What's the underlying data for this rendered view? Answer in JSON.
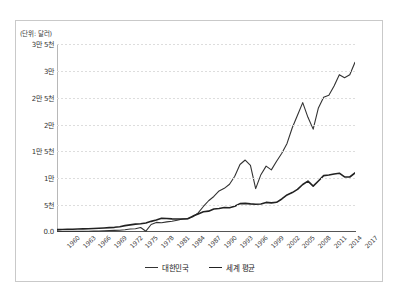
{
  "figure": {
    "unit_label": "(단위: 달러)",
    "accent_primary": "#333333",
    "accent_secondary": "#222222",
    "grid_color": "#dddddd",
    "frame_color": "#c9c9c9"
  },
  "legend": {
    "position": "bottom-center",
    "items": [
      {
        "label": "대한민국",
        "color": "#333333"
      },
      {
        "label": "세계 평균",
        "color": "#222222"
      }
    ]
  },
  "chart_data": {
    "type": "line",
    "title": "",
    "subtitle": "",
    "xlabel": "",
    "ylabel": "(단위: 달러)",
    "grid": true,
    "legend_position": "bottom-center",
    "ylim": [
      0,
      35000
    ],
    "ytick_values": [
      0,
      5000,
      10000,
      15000,
      20000,
      25000,
      30000,
      35000
    ],
    "ytick_labels": [
      "0.0",
      "5천",
      "1만",
      "1만 5천",
      "2만",
      "2만 5천",
      "3만",
      "3만 5천"
    ],
    "xlim": [
      1960,
      2017
    ],
    "xtick_labels": [
      "1960",
      "1963",
      "1966",
      "1969",
      "1972",
      "1975",
      "1978",
      "1981",
      "1984",
      "1987",
      "1990",
      "1993",
      "1996",
      "1999",
      "2002",
      "2005",
      "2008",
      "2011",
      "2014",
      "2017"
    ],
    "x": [
      1960,
      1961,
      1962,
      1963,
      1964,
      1965,
      1966,
      1967,
      1968,
      1969,
      1970,
      1971,
      1972,
      1973,
      1974,
      1975,
      1976,
      1977,
      1978,
      1979,
      1980,
      1981,
      1982,
      1983,
      1984,
      1985,
      1986,
      1987,
      1988,
      1989,
      1990,
      1991,
      1992,
      1993,
      1994,
      1995,
      1996,
      1997,
      1998,
      1999,
      2000,
      2001,
      2002,
      2003,
      2004,
      2005,
      2006,
      2007,
      2008,
      2009,
      2010,
      2011,
      2012,
      2013,
      2014,
      2015,
      2016,
      2017
    ],
    "series": [
      {
        "name": "대한민국",
        "color": "#333333",
        "values": [
          158,
          94,
          106,
          146,
          124,
          110,
          131,
          161,
          198,
          243,
          279,
          301,
          324,
          406,
          563,
          617,
          834,
          150,
          1400,
          1784,
          1715,
          1883,
          1992,
          2199,
          2413,
          2482,
          2835,
          3555,
          4749,
          5818,
          6610,
          7637,
          8126,
          8883,
          10385,
          12565,
          13403,
          12398,
          8085,
          10672,
          12257,
          11561,
          13165,
          14673,
          16496,
          19403,
          21743,
          24087,
          21350,
          19152,
          23087,
          25096,
          25467,
          27183,
          29290,
          28732,
          29289,
          31600
        ],
        "linewidth": 1.1,
        "annotations": [
          "1997-1998 Asian financial crisis dip",
          "2008-2009 global financial crisis dip"
        ]
      },
      {
        "name": "세계 평균",
        "color": "#222222",
        "values": [
          450,
          460,
          480,
          510,
          550,
          580,
          610,
          640,
          690,
          750,
          810,
          870,
          990,
          1180,
          1330,
          1460,
          1530,
          1680,
          1980,
          2230,
          2540,
          2520,
          2450,
          2420,
          2420,
          2470,
          2960,
          3340,
          3760,
          3880,
          4280,
          4380,
          4560,
          4520,
          4780,
          5290,
          5330,
          5230,
          5170,
          5220,
          5510,
          5430,
          5530,
          6150,
          6900,
          7340,
          7940,
          8850,
          9480,
          8540,
          9500,
          10500,
          10600,
          10800,
          10950,
          10250,
          10240,
          11000
        ],
        "linewidth": 1.6
      }
    ]
  }
}
